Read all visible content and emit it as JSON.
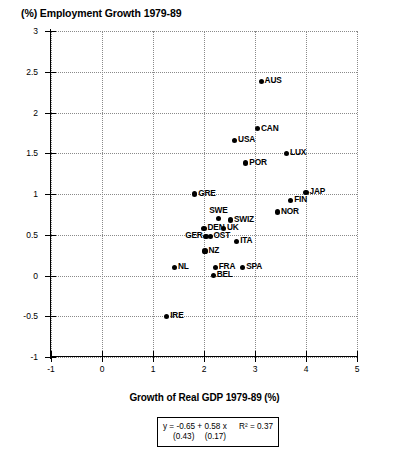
{
  "chart_data": {
    "type": "scatter",
    "title": "(%) Employment Growth 1979-89",
    "xlabel": "Growth of Real GDP 1979-89 (%)",
    "ylabel": "(%) Employment Growth 1979-89",
    "xlim": [
      -1,
      5
    ],
    "ylim": [
      -1,
      3
    ],
    "xticks": [
      "-1",
      "0",
      "1",
      "2",
      "3",
      "4",
      "5"
    ],
    "xtick_values": [
      -1,
      0,
      1,
      2,
      3,
      4,
      5
    ],
    "yticks": [
      "-1",
      "-0.5",
      "0",
      "0.5",
      "1",
      "1.5",
      "2",
      "2.5",
      "3"
    ],
    "ytick_values": [
      -1,
      -0.5,
      0,
      0.5,
      1,
      1.5,
      2,
      2.5,
      3
    ],
    "grid": true,
    "legend": "none",
    "marker_color": "#000000",
    "points": [
      {
        "label": "AUS",
        "x": 3.12,
        "y": 2.38,
        "label_side": "right"
      },
      {
        "label": "CAN",
        "x": 3.05,
        "y": 1.8,
        "label_side": "right"
      },
      {
        "label": "USA",
        "x": 2.6,
        "y": 1.66,
        "label_side": "right"
      },
      {
        "label": "LUX",
        "x": 3.62,
        "y": 1.5,
        "label_side": "right"
      },
      {
        "label": "POR",
        "x": 2.82,
        "y": 1.38,
        "label_side": "right"
      },
      {
        "label": "JAP",
        "x": 4.0,
        "y": 1.02,
        "label_side": "right"
      },
      {
        "label": "GRE",
        "x": 1.82,
        "y": 1.0,
        "label_side": "right"
      },
      {
        "label": "FIN",
        "x": 3.7,
        "y": 0.92,
        "label_side": "right"
      },
      {
        "label": "NOR",
        "x": 3.44,
        "y": 0.78,
        "label_side": "right"
      },
      {
        "label": "SWE",
        "x": 2.28,
        "y": 0.7,
        "label_side": "top"
      },
      {
        "label": "SWIZ",
        "x": 2.52,
        "y": 0.68,
        "label_side": "right"
      },
      {
        "label": "DEN",
        "x": 2.0,
        "y": 0.58,
        "label_side": "right"
      },
      {
        "label": "UK",
        "x": 2.38,
        "y": 0.58,
        "label_side": "right"
      },
      {
        "label": "OST",
        "x": 2.12,
        "y": 0.48,
        "label_side": "right"
      },
      {
        "label": "GER",
        "x": 2.04,
        "y": 0.48,
        "label_side": "left"
      },
      {
        "label": "ITA",
        "x": 2.64,
        "y": 0.42,
        "label_side": "right"
      },
      {
        "label": "NZ",
        "x": 2.02,
        "y": 0.3,
        "label_side": "right"
      },
      {
        "label": "NL",
        "x": 1.42,
        "y": 0.1,
        "label_side": "right"
      },
      {
        "label": "FRA",
        "x": 2.22,
        "y": 0.1,
        "label_side": "right"
      },
      {
        "label": "SPA",
        "x": 2.76,
        "y": 0.1,
        "label_side": "right"
      },
      {
        "label": "BEL",
        "x": 2.18,
        "y": 0.0,
        "label_side": "right"
      },
      {
        "label": "IRE",
        "x": 1.27,
        "y": -0.5,
        "label_side": "right"
      }
    ],
    "regression": {
      "equation": "y = -0.65 + 0.58 x",
      "intercept": -0.65,
      "slope": 0.58,
      "r_squared_label": "R² = 0.37",
      "r_squared": 0.37,
      "se_intercept": "(0.43)",
      "se_slope": "(0.17)"
    }
  }
}
